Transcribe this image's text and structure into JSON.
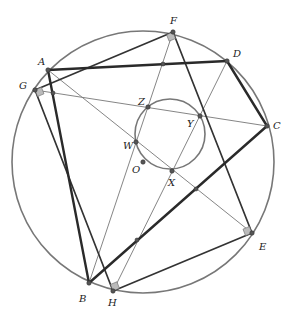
{
  "diagram": {
    "type": "geometry",
    "outer_circle": {
      "cx": 143,
      "cy": 162,
      "r": 131
    },
    "inner_circle": {
      "cx": 170,
      "cy": 134,
      "r": 35
    },
    "points": [
      {
        "name": "A",
        "x": 48,
        "y": 70,
        "lx": 38,
        "ly": 65
      },
      {
        "name": "F",
        "x": 173,
        "y": 32,
        "lx": 170,
        "ly": 24
      },
      {
        "name": "D",
        "x": 227,
        "y": 61,
        "lx": 233,
        "ly": 57
      },
      {
        "name": "G",
        "x": 35,
        "y": 90,
        "lx": 19,
        "ly": 89
      },
      {
        "name": "C",
        "x": 267,
        "y": 126,
        "lx": 273,
        "ly": 129
      },
      {
        "name": "Z",
        "x": 148,
        "y": 107,
        "lx": 138,
        "ly": 105
      },
      {
        "name": "Y",
        "x": 200,
        "y": 116,
        "lx": 187,
        "ly": 127
      },
      {
        "name": "W",
        "x": 136,
        "y": 142,
        "lx": 123,
        "ly": 149
      },
      {
        "name": "O",
        "x": 143,
        "y": 162,
        "lx": 132,
        "ly": 173
      },
      {
        "name": "X",
        "x": 172,
        "y": 171,
        "lx": 168,
        "ly": 186
      },
      {
        "name": "E",
        "x": 252,
        "y": 233,
        "lx": 259,
        "ly": 250
      },
      {
        "name": "B",
        "x": 89,
        "y": 283,
        "lx": 79,
        "ly": 302
      },
      {
        "name": "H",
        "x": 113,
        "y": 291,
        "lx": 108,
        "ly": 306
      }
    ],
    "unlabeled_points": [
      {
        "x": 163,
        "y": 64
      },
      {
        "x": 53,
        "y": 93
      },
      {
        "x": 196,
        "y": 189
      },
      {
        "x": 137,
        "y": 240
      }
    ],
    "thick_segments": [
      [
        "A",
        "D"
      ],
      [
        "D",
        "C"
      ],
      [
        "C",
        "B"
      ],
      [
        "B",
        "A"
      ]
    ],
    "medium_segments": [
      [
        "G",
        "F"
      ],
      [
        "F",
        "E"
      ],
      [
        "E",
        "H"
      ],
      [
        "H",
        "G"
      ]
    ],
    "thin_segments": [
      [
        "A",
        "E"
      ],
      [
        "G",
        "C"
      ],
      [
        "F",
        "B"
      ],
      [
        "D",
        "H"
      ]
    ],
    "right_angle_markers": [
      "F",
      "G",
      "E",
      "H"
    ]
  }
}
